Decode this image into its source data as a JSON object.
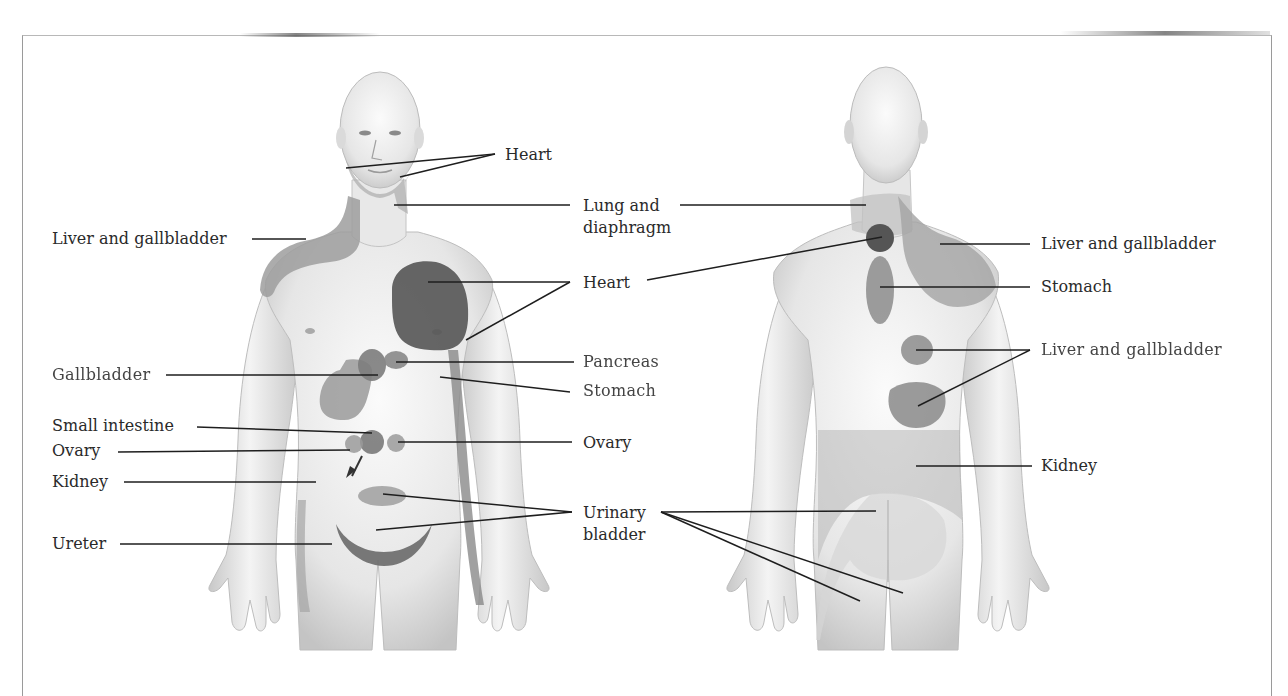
{
  "diagram": {
    "type": "referred-pain anatomical chart",
    "colors": {
      "skin": "#eeeeee",
      "skin_shade": "#cfcfcf",
      "region_light": "#a8a8a8",
      "region_mid": "#8c8c8c",
      "region_dark": "#5e5e5e",
      "leader_line": "#1e1e1e",
      "frame": "#9a9a9a"
    },
    "front_view": {
      "labels": [
        {
          "id": "heart-top",
          "text": "Heart",
          "side": "right"
        },
        {
          "id": "lung-diaphragm",
          "text": "Lung and\ndiaphragm",
          "side": "right"
        },
        {
          "id": "liver-gallbladder",
          "text": "Liver and gallbladder",
          "side": "left"
        },
        {
          "id": "heart-chest",
          "text": "Heart",
          "side": "right"
        },
        {
          "id": "gallbladder",
          "text": "Gallbladder",
          "side": "left"
        },
        {
          "id": "pancreas",
          "text": "Pancreas",
          "side": "right"
        },
        {
          "id": "stomach",
          "text": "Stomach",
          "side": "right"
        },
        {
          "id": "small-intestine",
          "text": "Small intestine",
          "side": "left"
        },
        {
          "id": "ovary-left",
          "text": "Ovary",
          "side": "left"
        },
        {
          "id": "ovary-right",
          "text": "Ovary",
          "side": "right"
        },
        {
          "id": "kidney",
          "text": "Kidney",
          "side": "left"
        },
        {
          "id": "urinary-bladder",
          "text": "Urinary\nbladder",
          "side": "right"
        },
        {
          "id": "ureter",
          "text": "Ureter",
          "side": "left"
        }
      ]
    },
    "back_view": {
      "labels": [
        {
          "id": "liver-gallbladder-upper",
          "text": "Liver and gallbladder"
        },
        {
          "id": "stomach",
          "text": "Stomach"
        },
        {
          "id": "liver-gallbladder-lower",
          "text": "Liver and gallbladder"
        },
        {
          "id": "kidney",
          "text": "Kidney"
        }
      ]
    }
  }
}
